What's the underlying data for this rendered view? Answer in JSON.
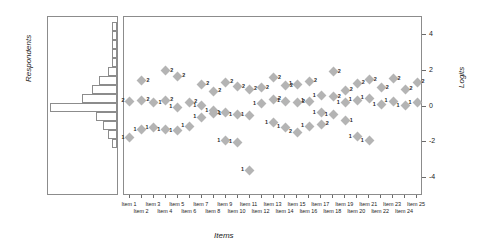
{
  "chart_data": {
    "type": "scatter",
    "title": "",
    "xlabel": "Items",
    "ylabel_left": "Respondents",
    "ylabel_right": "Logits",
    "ylim": [
      -5,
      5
    ],
    "yticks": [
      -4,
      -2,
      0,
      2,
      4
    ],
    "grid": false,
    "legend": "none",
    "categories": [
      "Item 1",
      "Item 2",
      "Item 3",
      "Item 4",
      "Item 5",
      "Item 6",
      "Item 7",
      "Item 8",
      "Item 9",
      "Item 10",
      "Item 11",
      "Item 12",
      "Item 13",
      "Item 14",
      "Item 15",
      "Item 16",
      "Item 17",
      "Item 18",
      "Item 19",
      "Item 20",
      "Item 21",
      "Item 22",
      "Item 23",
      "Item 24",
      "Item 25"
    ],
    "marker_color": "#b4b4b4",
    "marker_shape": "diamond",
    "points": [
      {
        "item": 1,
        "logit": 0.3,
        "label": "2",
        "side": "left"
      },
      {
        "item": 1,
        "logit": -1.75,
        "label": "1",
        "side": "left"
      },
      {
        "item": 2,
        "logit": 1.45,
        "label": "2",
        "side": "right"
      },
      {
        "item": 2,
        "logit": 0.35,
        "label": "2",
        "side": "right"
      },
      {
        "item": 2,
        "logit": -1.3,
        "label": "1",
        "side": "left"
      },
      {
        "item": 3,
        "logit": 0.2,
        "label": "1",
        "side": "right"
      },
      {
        "item": 3,
        "logit": -1.2,
        "label": "1",
        "side": "left"
      },
      {
        "item": 4,
        "logit": 2.0,
        "label": "2",
        "side": "right"
      },
      {
        "item": 4,
        "logit": 0.35,
        "label": "2",
        "side": "right"
      },
      {
        "item": 4,
        "logit": -1.3,
        "label": "1",
        "side": "left"
      },
      {
        "item": 5,
        "logit": 1.7,
        "label": "2",
        "side": "right"
      },
      {
        "item": 5,
        "logit": -0.05,
        "label": "1",
        "side": "left"
      },
      {
        "item": 5,
        "logit": -1.35,
        "label": "1",
        "side": "left"
      },
      {
        "item": 6,
        "logit": 0.25,
        "label": "2",
        "side": "right"
      },
      {
        "item": 6,
        "logit": -1.1,
        "label": "1",
        "side": "left"
      },
      {
        "item": 7,
        "logit": 1.25,
        "label": "2",
        "side": "right"
      },
      {
        "item": 7,
        "logit": 0.05,
        "label": "1",
        "side": "left"
      },
      {
        "item": 7,
        "logit": -0.6,
        "label": "1",
        "side": "left"
      },
      {
        "item": 8,
        "logit": 0.85,
        "label": "2",
        "side": "right"
      },
      {
        "item": 8,
        "logit": -0.25,
        "label": "1",
        "side": "left"
      },
      {
        "item": 8,
        "logit": -0.4,
        "label": "1",
        "side": "right"
      },
      {
        "item": 9,
        "logit": 1.35,
        "label": "2",
        "side": "right"
      },
      {
        "item": 9,
        "logit": -0.35,
        "label": "1",
        "side": "left"
      },
      {
        "item": 9,
        "logit": -1.9,
        "label": "1",
        "side": "left"
      },
      {
        "item": 10,
        "logit": 1.1,
        "label": "2",
        "side": "right"
      },
      {
        "item": 10,
        "logit": -0.45,
        "label": "1",
        "side": "left"
      },
      {
        "item": 10,
        "logit": -2.0,
        "label": "1",
        "side": "left"
      },
      {
        "item": 11,
        "logit": 0.95,
        "label": "2",
        "side": "right"
      },
      {
        "item": 11,
        "logit": -0.5,
        "label": "1",
        "side": "left"
      },
      {
        "item": 11,
        "logit": -3.55,
        "label": "1",
        "side": "left"
      },
      {
        "item": 12,
        "logit": 1.05,
        "label": "2",
        "side": "right"
      },
      {
        "item": 12,
        "logit": 0.15,
        "label": "1",
        "side": "left"
      },
      {
        "item": 13,
        "logit": 1.6,
        "label": "2",
        "side": "right"
      },
      {
        "item": 13,
        "logit": 0.4,
        "label": "2",
        "side": "right"
      },
      {
        "item": 13,
        "logit": -0.9,
        "label": "1",
        "side": "left"
      },
      {
        "item": 14,
        "logit": 1.15,
        "label": "2",
        "side": "right"
      },
      {
        "item": 14,
        "logit": 0.3,
        "label": "1",
        "side": "left"
      },
      {
        "item": 14,
        "logit": -1.15,
        "label": "1",
        "side": "left"
      },
      {
        "item": 15,
        "logit": 1.25,
        "label": "1",
        "side": "left"
      },
      {
        "item": 15,
        "logit": 0.25,
        "label": "2",
        "side": "right"
      },
      {
        "item": 15,
        "logit": -1.45,
        "label": "2",
        "side": "left"
      },
      {
        "item": 16,
        "logit": 1.4,
        "label": "2",
        "side": "right"
      },
      {
        "item": 16,
        "logit": 0.3,
        "label": "1",
        "side": "left"
      },
      {
        "item": 16,
        "logit": -1.1,
        "label": "1",
        "side": "left"
      },
      {
        "item": 17,
        "logit": 0.6,
        "label": "1",
        "side": "left"
      },
      {
        "item": 17,
        "logit": -0.35,
        "label": "1",
        "side": "left"
      },
      {
        "item": 17,
        "logit": -1.0,
        "label": "2",
        "side": "right"
      },
      {
        "item": 18,
        "logit": 1.95,
        "label": "2",
        "side": "right"
      },
      {
        "item": 18,
        "logit": 0.55,
        "label": "2",
        "side": "right"
      },
      {
        "item": 18,
        "logit": -0.45,
        "label": "1",
        "side": "left"
      },
      {
        "item": 19,
        "logit": 0.9,
        "label": "2",
        "side": "right"
      },
      {
        "item": 19,
        "logit": 0.2,
        "label": "1",
        "side": "left"
      },
      {
        "item": 19,
        "logit": -0.8,
        "label": "1",
        "side": "right"
      },
      {
        "item": 20,
        "logit": 1.3,
        "label": "2",
        "side": "right"
      },
      {
        "item": 20,
        "logit": 0.35,
        "label": "1",
        "side": "left"
      },
      {
        "item": 20,
        "logit": -1.7,
        "label": "1",
        "side": "left"
      },
      {
        "item": 21,
        "logit": 1.5,
        "label": "2",
        "side": "right"
      },
      {
        "item": 21,
        "logit": 0.45,
        "label": "1",
        "side": "left"
      },
      {
        "item": 21,
        "logit": -1.9,
        "label": "1",
        "side": "left"
      },
      {
        "item": 22,
        "logit": 1.05,
        "label": "2",
        "side": "right"
      },
      {
        "item": 22,
        "logit": 0.1,
        "label": "1",
        "side": "left"
      },
      {
        "item": 23,
        "logit": 1.55,
        "label": "2",
        "side": "right"
      },
      {
        "item": 23,
        "logit": 0.3,
        "label": "1",
        "side": "left"
      },
      {
        "item": 24,
        "logit": 0.95,
        "label": "2",
        "side": "right"
      },
      {
        "item": 24,
        "logit": 0.05,
        "label": "1",
        "side": "left"
      },
      {
        "item": 25,
        "logit": 1.35,
        "label": "2",
        "side": "right"
      },
      {
        "item": 25,
        "logit": 0.2,
        "label": "1",
        "side": "left"
      }
    ],
    "histogram": {
      "orientation": "horizontal",
      "ylabel": "Respondents",
      "bins": [
        {
          "logit_center": 4.45,
          "count": 2
        },
        {
          "logit_center": 3.95,
          "count": 2
        },
        {
          "logit_center": 3.45,
          "count": 2
        },
        {
          "logit_center": 2.95,
          "count": 2
        },
        {
          "logit_center": 2.45,
          "count": 2
        },
        {
          "logit_center": 1.95,
          "count": 4
        },
        {
          "logit_center": 1.45,
          "count": 8
        },
        {
          "logit_center": 0.95,
          "count": 11
        },
        {
          "logit_center": 0.45,
          "count": 15
        },
        {
          "logit_center": -0.05,
          "count": 29
        },
        {
          "logit_center": -0.55,
          "count": 9
        },
        {
          "logit_center": -1.05,
          "count": 6
        },
        {
          "logit_center": -1.55,
          "count": 4
        },
        {
          "logit_center": -2.05,
          "count": 2
        }
      ]
    }
  }
}
